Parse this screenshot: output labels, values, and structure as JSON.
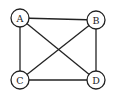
{
  "graph": {
    "nodes": [
      {
        "id": "A",
        "label": "A",
        "x": 20,
        "y": 18
      },
      {
        "id": "B",
        "label": "B",
        "x": 96,
        "y": 20
      },
      {
        "id": "C",
        "label": "C",
        "x": 20,
        "y": 80
      },
      {
        "id": "D",
        "label": "D",
        "x": 96,
        "y": 80
      }
    ],
    "edges": [
      [
        "A",
        "B"
      ],
      [
        "A",
        "C"
      ],
      [
        "A",
        "D"
      ],
      [
        "B",
        "C"
      ],
      [
        "B",
        "D"
      ],
      [
        "C",
        "D"
      ]
    ],
    "node_radius": 9,
    "colors": {
      "stroke": "#222222",
      "fill": "#ffffff"
    }
  }
}
